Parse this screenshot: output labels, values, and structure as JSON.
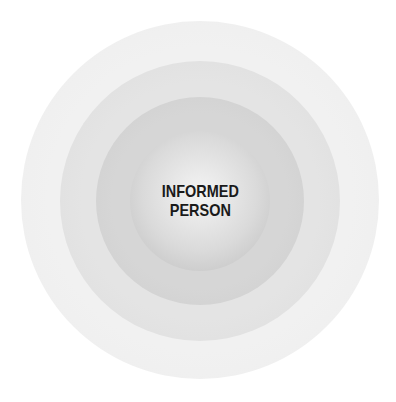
{
  "diagram": {
    "type": "concentric-circles",
    "rings": [
      {
        "level": 1,
        "color": "#f0f0f0"
      },
      {
        "level": 2,
        "color": "#e2e2e2"
      },
      {
        "level": 3,
        "color": "#d4d4d4"
      },
      {
        "level": 4,
        "color": "#cfcfcf"
      }
    ],
    "center_label": {
      "line1": "INFORMED",
      "line2": "PERSON"
    }
  }
}
